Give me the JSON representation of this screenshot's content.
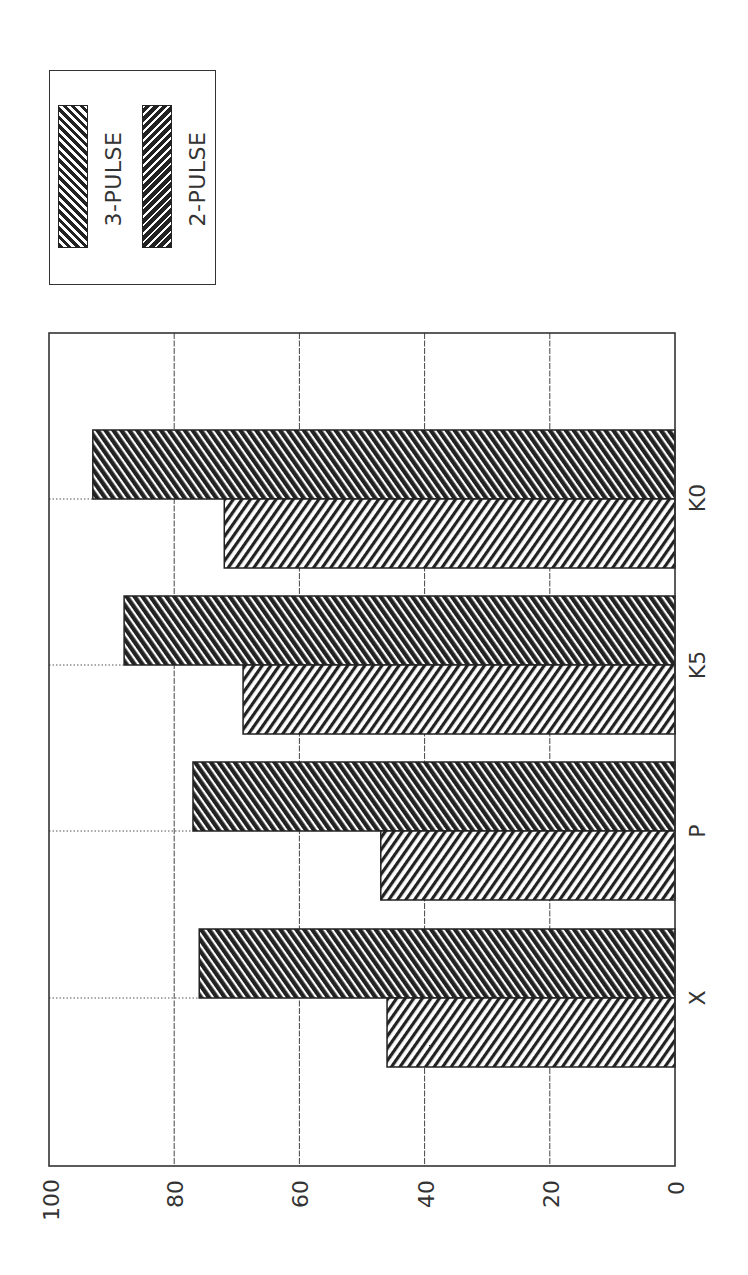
{
  "legend": {
    "items": [
      {
        "label": "3-PULSE",
        "pattern": "hatch-backslash-light"
      },
      {
        "label": "2-PULSE",
        "pattern": "hatch-slash-dark"
      }
    ]
  },
  "axis": {
    "tick_labels": [
      "0",
      "20",
      "40",
      "60",
      "80",
      "100"
    ]
  },
  "categories": [
    "X",
    "P",
    "K5",
    "K0"
  ],
  "chart_data": {
    "type": "bar",
    "orientation": "horizontal (rotated 90°, value axis runs right-to-left, categories bottom-to-top)",
    "title": "",
    "xlabel": "",
    "ylabel": "",
    "categories": [
      "X",
      "P",
      "K5",
      "K0"
    ],
    "series": [
      {
        "name": "3-PULSE",
        "values": [
          46,
          47,
          69,
          72
        ]
      },
      {
        "name": "2-PULSE",
        "values": [
          76,
          77,
          88,
          93
        ]
      }
    ],
    "ylim": [
      0,
      100
    ],
    "yticks": [
      0,
      20,
      40,
      60,
      80,
      100
    ],
    "grid": true,
    "legend_position": "top-left (rotated)",
    "colors": {
      "stroke": "#222222",
      "grid": "#444444",
      "background": "#ffffff"
    }
  }
}
